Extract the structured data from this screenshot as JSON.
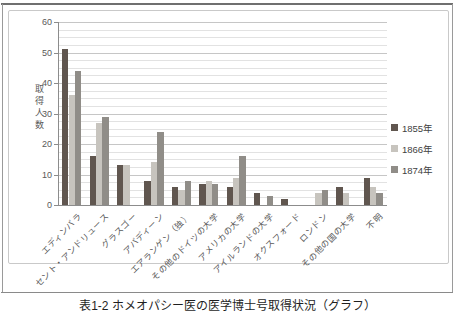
{
  "caption": "表1-2 ホメオパシー医の医学博士号取得状況（グラフ）",
  "chart_data": {
    "type": "bar",
    "title": "",
    "xlabel": "",
    "ylabel": "取得人数",
    "ylim": [
      0,
      60
    ],
    "ytick_major": 10,
    "ytick_minor": 2.5,
    "yticks": [
      0,
      10,
      20,
      30,
      40,
      50,
      60
    ],
    "grid": true,
    "legend_position": "right",
    "categories": [
      "エディンバラ",
      "セント・アンドリュース",
      "グラスゴー",
      "アバディーン",
      "エアランゲン（独）",
      "その他のドイツの大学",
      "アメリカの大学",
      "アイルランドの大学",
      "オクスフォード",
      "ロンドン",
      "その他の国の大学",
      "不明"
    ],
    "series": [
      {
        "name": "1855年",
        "color": "#60564f",
        "values": [
          51,
          16,
          13,
          8,
          6,
          7,
          6,
          4,
          2,
          0,
          6,
          9
        ]
      },
      {
        "name": "1866年",
        "color": "#c7c4be",
        "values": [
          36,
          27,
          13,
          14,
          5,
          8,
          9,
          0,
          0,
          4,
          4,
          6
        ]
      },
      {
        "name": "1874年",
        "color": "#908d88",
        "values": [
          44,
          29,
          0,
          24,
          8,
          7,
          16,
          3,
          0,
          5,
          0,
          4
        ]
      }
    ]
  }
}
